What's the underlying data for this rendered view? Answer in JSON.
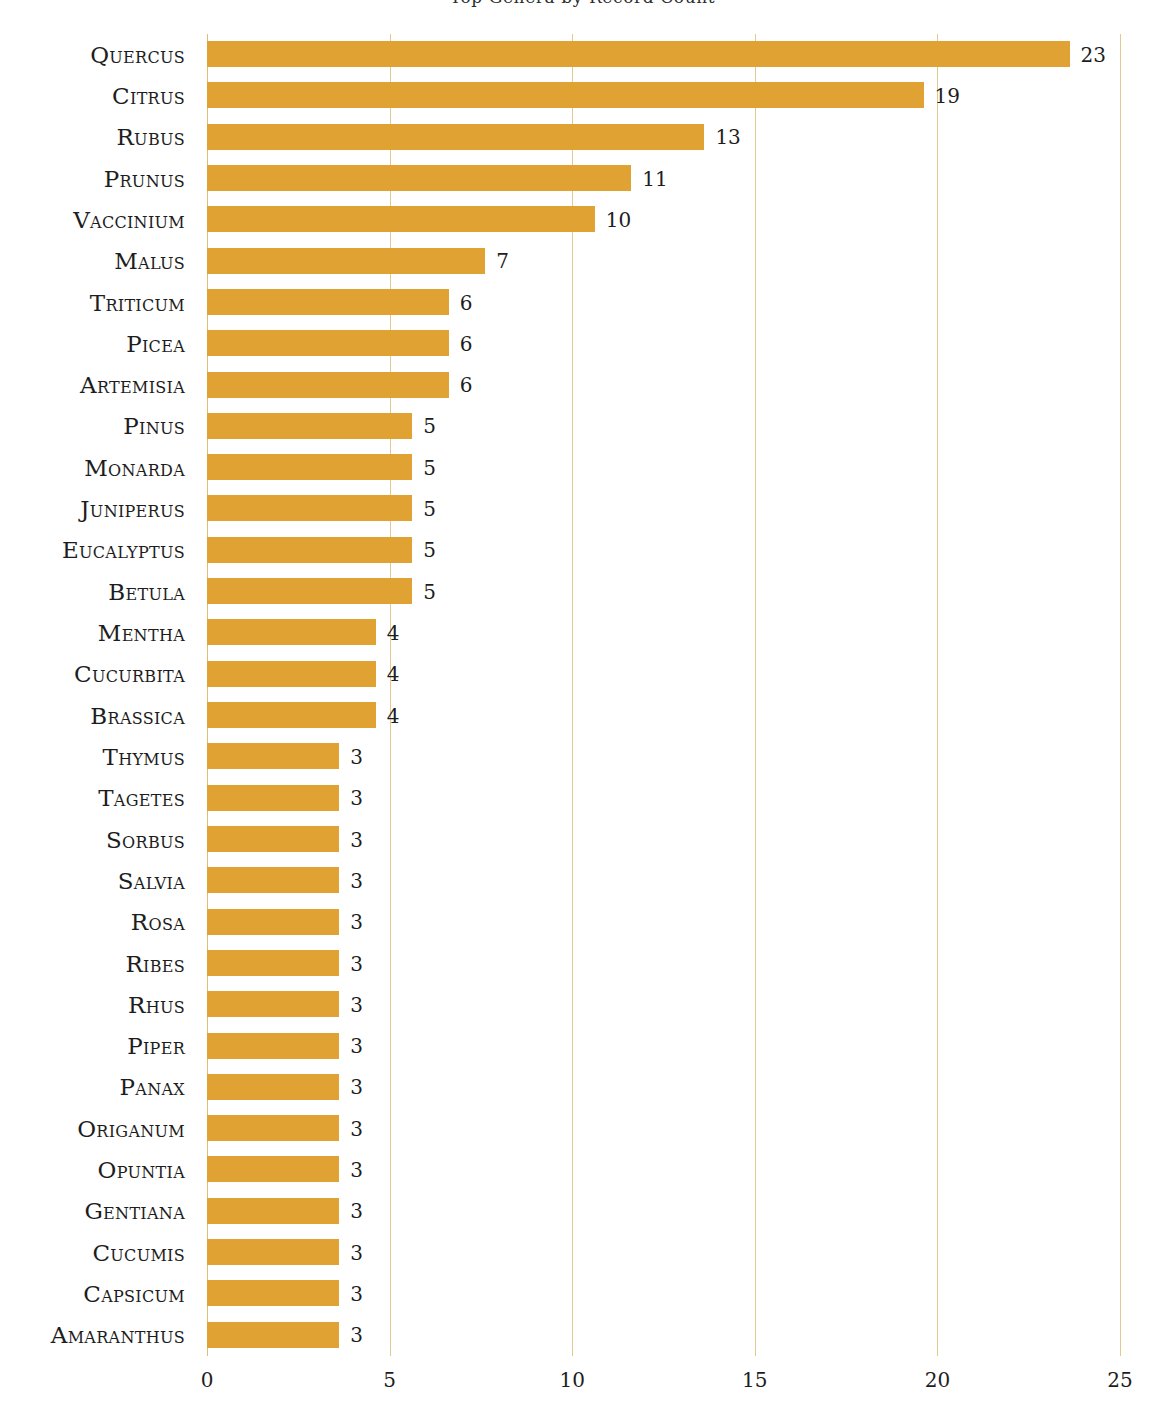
{
  "chart_data": {
    "type": "bar",
    "orientation": "horizontal",
    "title": "Top Genera by Record Count",
    "xlabel": "",
    "ylabel": "",
    "xlim": [
      0,
      25
    ],
    "xticks": [
      0,
      5,
      10,
      15,
      20,
      25
    ],
    "xtick_labels": [
      "0",
      "5",
      "10",
      "15",
      "20",
      "25"
    ],
    "grid": "vertical",
    "legend": "none",
    "bar_color": "#e0a333",
    "gridline_color": "#e3c98f",
    "text_color": "#1d1d1d",
    "categories": [
      "Quercus",
      "Citrus",
      "Rubus",
      "Prunus",
      "Vaccinium",
      "Malus",
      "Triticum",
      "Picea",
      "Artemisia",
      "Pinus",
      "Monarda",
      "Juniperus",
      "Eucalyptus",
      "Betula",
      "Mentha",
      "Cucurbita",
      "Brassica",
      "Thymus",
      "Tagetes",
      "Sorbus",
      "Salvia",
      "Rosa",
      "Ribes",
      "Rhus",
      "Piper",
      "Panax",
      "Origanum",
      "Opuntia",
      "Gentiana",
      "Cucumis",
      "Capsicum",
      "Amaranthus"
    ],
    "values": [
      23,
      19,
      13,
      11,
      10,
      7,
      6,
      6,
      6,
      5,
      5,
      5,
      5,
      5,
      4,
      4,
      4,
      3,
      3,
      3,
      3,
      3,
      3,
      3,
      3,
      3,
      3,
      3,
      3,
      3,
      3,
      3
    ],
    "value_labels": [
      "23",
      "19",
      "13",
      "11",
      "10",
      "7",
      "6",
      "6",
      "6",
      "5",
      "5",
      "5",
      "5",
      "5",
      "4",
      "4",
      "4",
      "3",
      "3",
      "3",
      "3",
      "3",
      "3",
      "3",
      "3",
      "3",
      "3",
      "3",
      "3",
      "3",
      "3",
      "3"
    ]
  }
}
